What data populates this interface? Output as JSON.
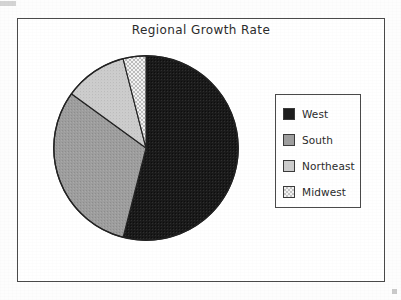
{
  "chart_data": {
    "type": "pie",
    "title": "Regional Growth Rate",
    "categories": [
      "West",
      "South",
      "Northeast",
      "Midwest"
    ],
    "values": [
      54,
      31,
      11,
      4
    ],
    "units": "percent",
    "start_angle_deg": 90,
    "direction": "clockwise",
    "legend_position": "right",
    "grid": false,
    "slice_colors": [
      "#1c1c1c",
      "#9a9a9a",
      "#c6c6c6",
      "#e4e4e4"
    ],
    "slices": [
      {
        "label": "West",
        "value": 54,
        "sweep_deg": 194.4,
        "fill": "#1c1c1c",
        "pattern": "solid-dark"
      },
      {
        "label": "South",
        "value": 31,
        "sweep_deg": 111.6,
        "fill": "#9a9a9a",
        "pattern": "medium-gray"
      },
      {
        "label": "Northeast",
        "value": 11,
        "sweep_deg": 39.6,
        "fill": "#c6c6c6",
        "pattern": "light-gray"
      },
      {
        "label": "Midwest",
        "value": 4,
        "sweep_deg": 14.4,
        "fill": "#e4e4e4",
        "pattern": "checker"
      }
    ]
  },
  "legend": {
    "items": [
      {
        "label": "West"
      },
      {
        "label": "South"
      },
      {
        "label": "Northeast"
      },
      {
        "label": "Midwest"
      }
    ]
  },
  "colors": {
    "frame": "#4a4a4a",
    "text": "#2b2b2b",
    "background": "#ffffff",
    "slice_outline": "#222222"
  }
}
